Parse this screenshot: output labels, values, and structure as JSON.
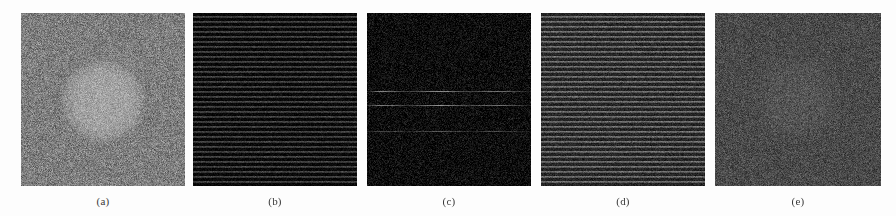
{
  "figure": {
    "background_color": "#fdfdfd",
    "panel_count": 5,
    "panels": [
      {
        "id": "a",
        "caption": "(a)",
        "description": "uniform mid-gray speckle noise image with a brighter circular disk near the center",
        "base_color": "#7e7e7e",
        "pattern": "noise",
        "has_circle": true,
        "circle_center_pct": [
          50,
          51
        ],
        "circle_radius_px": 42,
        "stripes": false,
        "width_px": 164,
        "height_px": 173,
        "left_px": 21,
        "top_px": 13
      },
      {
        "id": "b",
        "caption": "(b)",
        "description": "very dark noise image with fine regular horizontal stripe banding",
        "base_color": "#141414",
        "pattern": "striped-noise",
        "has_circle": false,
        "stripes": true,
        "stripe_period_px": 5,
        "width_px": 164,
        "height_px": 173,
        "left_px": 193,
        "top_px": 13
      },
      {
        "id": "c",
        "caption": "(c)",
        "description": "near-black noise image with a few bright horizontal streak lines",
        "base_color": "#0d0d0d",
        "pattern": "noise-with-streaks",
        "has_circle": false,
        "stripes": false,
        "streaks_y_pct": [
          45,
          53,
          68
        ],
        "width_px": 164,
        "height_px": 173,
        "left_px": 367,
        "top_px": 13
      },
      {
        "id": "d",
        "caption": "(d)",
        "description": "mid-dark gray noise image with regular horizontal stripe banding",
        "base_color": "#3f3f3f",
        "pattern": "striped-noise",
        "has_circle": false,
        "stripes": true,
        "stripe_period_px": 5,
        "width_px": 164,
        "height_px": 173,
        "left_px": 541,
        "top_px": 13
      },
      {
        "id": "e",
        "caption": "(e)",
        "description": "flat dark gray noise image with a very faint circular blob near the center",
        "base_color": "#4a4a4a",
        "pattern": "noise",
        "has_circle": true,
        "circle_center_pct": [
          50,
          50
        ],
        "circle_radius_px": 46,
        "stripes": false,
        "width_px": 166,
        "height_px": 173,
        "left_px": 715,
        "top_px": 13
      }
    ]
  }
}
